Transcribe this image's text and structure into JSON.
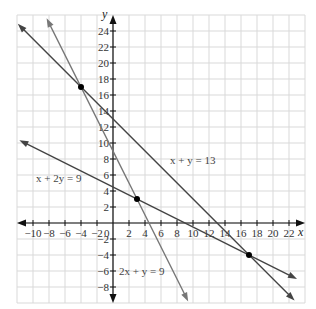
{
  "chart_data": {
    "type": "line",
    "title": "",
    "xlabel": "x",
    "ylabel": "y",
    "xlim": [
      -12,
      24
    ],
    "ylim": [
      -10,
      26
    ],
    "grid": true,
    "x_ticks": [
      "−10",
      "−8",
      "−6",
      "−4",
      "−2",
      "0",
      "2",
      "4",
      "6",
      "8",
      "10",
      "12",
      "14",
      "16",
      "18",
      "20",
      "22"
    ],
    "y_ticks": [
      "24",
      "22",
      "20",
      "18",
      "16",
      "14",
      "12",
      "10",
      "8",
      "6",
      "4",
      "2",
      "−2",
      "−4",
      "−6",
      "−8"
    ],
    "series": [
      {
        "name": "x + y = 13",
        "equation": "x + y = 13",
        "color": "#444444",
        "x": [
          -11.9,
          22.7
        ],
        "y": [
          24.9,
          -9.7
        ]
      },
      {
        "name": "2x + y = 9",
        "equation": "2x + y = 9",
        "color": "#777777",
        "x": [
          -8.3,
          9.4
        ],
        "y": [
          25.6,
          -9.8
        ]
      },
      {
        "name": "x + 2y = 9",
        "equation": "x + 2y = 9",
        "color": "#444444",
        "x": [
          -11.7,
          23.0
        ],
        "y": [
          10.35,
          -7.0
        ]
      }
    ],
    "points": [
      {
        "x": -4,
        "y": 17
      },
      {
        "x": 3,
        "y": 3
      },
      {
        "x": 17,
        "y": -4
      }
    ],
    "annotations": [
      {
        "text": "x + y = 13",
        "x": 7,
        "y": 7.5
      },
      {
        "text": "2x + y = 9",
        "x": 0.7,
        "y": -6
      },
      {
        "text": "x + 2y = 9",
        "x": -10.5,
        "y": 5.8
      }
    ]
  },
  "labels": {
    "x_axis": "x",
    "y_axis": "y",
    "origin": "0",
    "line1": "x + y = 13",
    "line2": "2x + y = 9",
    "line3": "x + 2y = 9"
  }
}
